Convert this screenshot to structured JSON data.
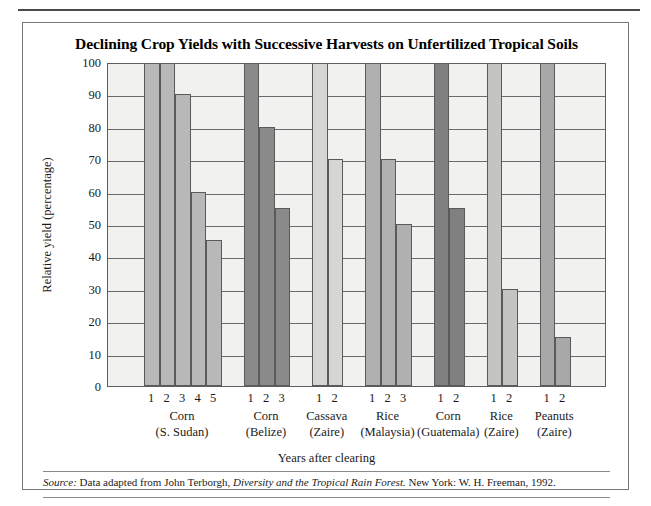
{
  "figure": {
    "title": "Declining Crop Yields with Successive Harvests on Unfertilized Tropical Soils",
    "source_prefix": "Source:",
    "source_text_1": " Data adapted from John Terborgh, ",
    "source_italic": "Diversity and the Tropical Rain Forest.",
    "source_text_2": " New York: W. H. Freeman, 1992."
  },
  "chart_data": {
    "type": "bar",
    "title": "Declining Crop Yields with Successive Harvests on Unfertilized Tropical Soils",
    "xlabel": "Years after clearing",
    "ylabel": "Relative yield (percentage)",
    "ylim": [
      0,
      100
    ],
    "ytick_labels": [
      "0",
      "10",
      "20",
      "30",
      "40",
      "50",
      "60",
      "70",
      "80",
      "90",
      "100"
    ],
    "yticks": [
      0,
      10,
      20,
      30,
      40,
      50,
      60,
      70,
      80,
      90,
      100
    ],
    "grid": true,
    "legend": "none",
    "groups": [
      {
        "crop": "Corn",
        "place": "(S. Sudan)",
        "color": "#b8b8b8",
        "categories": [
          "1",
          "2",
          "3",
          "4",
          "5"
        ],
        "values": [
          100,
          100,
          90,
          60,
          45
        ]
      },
      {
        "crop": "Corn",
        "place": "(Belize)",
        "color": "#8a8a8a",
        "categories": [
          "1",
          "2",
          "3"
        ],
        "values": [
          100,
          80,
          55
        ]
      },
      {
        "crop": "Cassava",
        "place": "(Zaire)",
        "color": "#d6d6d2",
        "categories": [
          "1",
          "2"
        ],
        "values": [
          100,
          70
        ]
      },
      {
        "crop": "Rice",
        "place": "(Malaysia)",
        "color": "#b0b0b0",
        "categories": [
          "1",
          "2",
          "3"
        ],
        "values": [
          100,
          70,
          50
        ]
      },
      {
        "crop": "Corn",
        "place": "(Guatemala)",
        "color": "#808080",
        "categories": [
          "1",
          "2"
        ],
        "values": [
          100,
          55
        ]
      },
      {
        "crop": "Rice",
        "place": "(Zaire)",
        "color": "#c4c4c0",
        "categories": [
          "1",
          "2"
        ],
        "values": [
          100,
          30
        ]
      },
      {
        "crop": "Peanuts",
        "place": "(Zaire)",
        "color": "#a8a8a8",
        "categories": [
          "1",
          "2"
        ],
        "values": [
          100,
          15
        ]
      }
    ]
  }
}
